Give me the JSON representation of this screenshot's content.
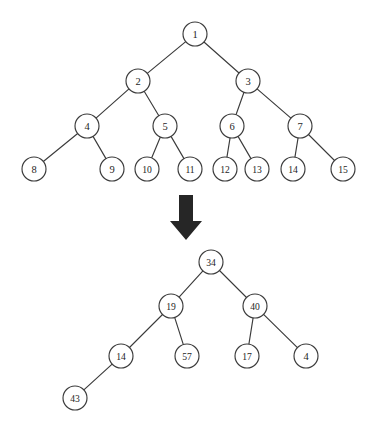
{
  "figure": {
    "background_color": "#ffffff",
    "stroke_color": "#3b3b3b",
    "label_color": "#1e1e1e",
    "arrow_color": "#262626",
    "node_radius": 12
  },
  "arrow": {
    "name": "down-arrow",
    "direction": "down",
    "shaft_x1": 179,
    "shaft_x2": 193,
    "shaft_y_top": 195,
    "shaft_y_bottom": 221,
    "head_x_left": 170,
    "head_x_right": 202,
    "head_y_top": 221,
    "tip_x": 186,
    "tip_y": 240
  },
  "trees": [
    {
      "id": "top-tree",
      "name": "complete-binary-tree-indices",
      "caption": "",
      "nodes": [
        {
          "id": "t1",
          "label": "1",
          "cx": 195,
          "cy": 34,
          "level": 0
        },
        {
          "id": "t2",
          "label": "2",
          "cx": 138,
          "cy": 81,
          "level": 1
        },
        {
          "id": "t3",
          "label": "3",
          "cx": 248,
          "cy": 81,
          "level": 1
        },
        {
          "id": "t4",
          "label": "4",
          "cx": 87,
          "cy": 126,
          "level": 2
        },
        {
          "id": "t5",
          "label": "5",
          "cx": 165,
          "cy": 126,
          "level": 2
        },
        {
          "id": "t6",
          "label": "6",
          "cx": 232,
          "cy": 126,
          "level": 2
        },
        {
          "id": "t7",
          "label": "7",
          "cx": 300,
          "cy": 126,
          "level": 2
        },
        {
          "id": "t8",
          "label": "8",
          "cx": 34,
          "cy": 169,
          "level": 3
        },
        {
          "id": "t9",
          "label": "9",
          "cx": 112,
          "cy": 169,
          "level": 3
        },
        {
          "id": "t10",
          "label": "10",
          "cx": 147,
          "cy": 169,
          "level": 3
        },
        {
          "id": "t11",
          "label": "11",
          "cx": 190,
          "cy": 169,
          "level": 3
        },
        {
          "id": "t12",
          "label": "12",
          "cx": 225,
          "cy": 169,
          "level": 3
        },
        {
          "id": "t13",
          "label": "13",
          "cx": 257,
          "cy": 169,
          "level": 3
        },
        {
          "id": "t14",
          "label": "14",
          "cx": 293,
          "cy": 169,
          "level": 3
        },
        {
          "id": "t15",
          "label": "15",
          "cx": 343,
          "cy": 169,
          "level": 3
        }
      ],
      "edges": [
        {
          "from": "t1",
          "to": "t2"
        },
        {
          "from": "t1",
          "to": "t3"
        },
        {
          "from": "t2",
          "to": "t4"
        },
        {
          "from": "t2",
          "to": "t5"
        },
        {
          "from": "t3",
          "to": "t6"
        },
        {
          "from": "t3",
          "to": "t7"
        },
        {
          "from": "t4",
          "to": "t8"
        },
        {
          "from": "t4",
          "to": "t9"
        },
        {
          "from": "t5",
          "to": "t10"
        },
        {
          "from": "t5",
          "to": "t11"
        },
        {
          "from": "t6",
          "to": "t12"
        },
        {
          "from": "t6",
          "to": "t13"
        },
        {
          "from": "t7",
          "to": "t14"
        },
        {
          "from": "t7",
          "to": "t15"
        }
      ]
    },
    {
      "id": "bottom-tree",
      "name": "binary-tree-values",
      "caption": "",
      "nodes": [
        {
          "id": "b34",
          "label": "34",
          "cx": 211,
          "cy": 262,
          "level": 0
        },
        {
          "id": "b19",
          "label": "19",
          "cx": 171,
          "cy": 306,
          "level": 1
        },
        {
          "id": "b40",
          "label": "40",
          "cx": 255,
          "cy": 306,
          "level": 1
        },
        {
          "id": "b14",
          "label": "14",
          "cx": 121,
          "cy": 356,
          "level": 2
        },
        {
          "id": "b57",
          "label": "57",
          "cx": 187,
          "cy": 356,
          "level": 2
        },
        {
          "id": "b17",
          "label": "17",
          "cx": 247,
          "cy": 356,
          "level": 2
        },
        {
          "id": "b4",
          "label": "4",
          "cx": 306,
          "cy": 356,
          "level": 2
        },
        {
          "id": "b43",
          "label": "43",
          "cx": 75,
          "cy": 398,
          "level": 3
        }
      ],
      "edges": [
        {
          "from": "b34",
          "to": "b19"
        },
        {
          "from": "b34",
          "to": "b40"
        },
        {
          "from": "b19",
          "to": "b14"
        },
        {
          "from": "b19",
          "to": "b57"
        },
        {
          "from": "b40",
          "to": "b17"
        },
        {
          "from": "b40",
          "to": "b4"
        },
        {
          "from": "b14",
          "to": "b43"
        }
      ]
    }
  ]
}
